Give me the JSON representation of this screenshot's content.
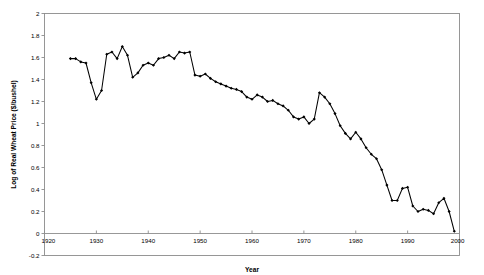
{
  "chart_data": {
    "type": "line",
    "title": "",
    "subtitle": "",
    "xlabel": "Year",
    "ylabel": "Log of Real Wheat Price ($/bushel)",
    "xlim": [
      1920,
      2000
    ],
    "ylim": [
      -0.2,
      2.0
    ],
    "xticks": [
      1920,
      1930,
      1940,
      1950,
      1960,
      1970,
      1980,
      1990,
      2000
    ],
    "xtick_labels": [
      "1920",
      "1930",
      "1940",
      "1950",
      "1960",
      "1970",
      "1980",
      "1990",
      "2000"
    ],
    "yticks": [
      -0.2,
      0,
      0.2,
      0.4,
      0.6,
      0.8,
      1.0,
      1.2,
      1.4,
      1.6,
      1.8,
      2.0
    ],
    "ytick_labels": [
      "-0.2",
      "0",
      "0.2",
      "0.4",
      "0.6",
      "0.8",
      "1",
      "1.2",
      "1.4",
      "1.6",
      "1.8",
      "2"
    ],
    "grid": false,
    "legend": false,
    "legend_position": "none",
    "markers": "filled-diamond",
    "line_color": "#000000",
    "frame_color": "#8c8c8c",
    "series": [
      {
        "name": "Log of Real Wheat Price",
        "x": [
          1925,
          1926,
          1927,
          1928,
          1929,
          1930,
          1931,
          1932,
          1933,
          1934,
          1935,
          1936,
          1937,
          1938,
          1939,
          1940,
          1941,
          1942,
          1943,
          1944,
          1945,
          1946,
          1947,
          1948,
          1949,
          1950,
          1951,
          1952,
          1953,
          1954,
          1955,
          1956,
          1957,
          1958,
          1959,
          1960,
          1961,
          1962,
          1963,
          1964,
          1965,
          1966,
          1967,
          1968,
          1969,
          1970,
          1971,
          1972,
          1973,
          1974,
          1975,
          1976,
          1977,
          1978,
          1979,
          1980,
          1981,
          1982,
          1983,
          1984,
          1985,
          1986,
          1987,
          1988,
          1989,
          1990,
          1991,
          1992,
          1993,
          1994,
          1995,
          1996,
          1997,
          1998,
          1999
        ],
        "values": [
          1.59,
          1.59,
          1.56,
          1.55,
          1.37,
          1.22,
          1.3,
          1.63,
          1.65,
          1.59,
          1.7,
          1.62,
          1.42,
          1.46,
          1.53,
          1.55,
          1.53,
          1.59,
          1.6,
          1.62,
          1.59,
          1.65,
          1.64,
          1.65,
          1.44,
          1.43,
          1.45,
          1.41,
          1.38,
          1.36,
          1.34,
          1.32,
          1.31,
          1.29,
          1.24,
          1.22,
          1.26,
          1.24,
          1.2,
          1.21,
          1.18,
          1.16,
          1.12,
          1.06,
          1.04,
          1.06,
          1.0,
          1.04,
          1.28,
          1.24,
          1.18,
          1.09,
          0.98,
          0.91,
          0.86,
          0.92,
          0.86,
          0.78,
          0.72,
          0.68,
          0.58,
          0.44,
          0.3,
          0.3,
          0.41,
          0.42,
          0.25,
          0.2,
          0.22,
          0.21,
          0.18,
          0.28,
          0.32,
          0.2,
          0.02
        ]
      }
    ]
  }
}
